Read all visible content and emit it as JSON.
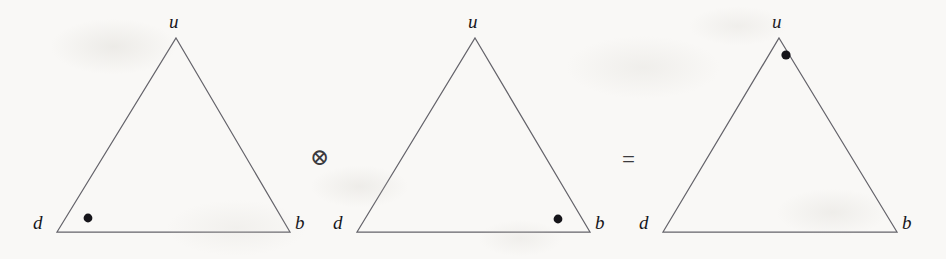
{
  "figure": {
    "caption_text": "",
    "background_color": "#f9f8f6",
    "line_color": "#64636a",
    "dot_color": "#16151a",
    "label_color": "#17161a",
    "width": 946,
    "height": 259
  },
  "triangles": [
    {
      "id": "triangle-left",
      "apex": {
        "x": 176,
        "y": 38
      },
      "bottom_left": {
        "x": 57,
        "y": 232
      },
      "bottom_right": {
        "x": 290,
        "y": 232
      },
      "labels": {
        "top": "u",
        "bottom_left": "d",
        "bottom_right": "b"
      },
      "label_positions": {
        "top": {
          "x": 169,
          "y": 12
        },
        "bottom_left": {
          "x": 33,
          "y": 213
        },
        "bottom_right": {
          "x": 295,
          "y": 213
        }
      },
      "weight_dot": {
        "x": 88,
        "y": 218,
        "radius": 4.4
      }
    },
    {
      "id": "triangle-middle",
      "apex": {
        "x": 475,
        "y": 38
      },
      "bottom_left": {
        "x": 357,
        "y": 232
      },
      "bottom_right": {
        "x": 590,
        "y": 232
      },
      "labels": {
        "top": "u",
        "bottom_left": "d",
        "bottom_right": "b"
      },
      "label_positions": {
        "top": {
          "x": 468,
          "y": 12
        },
        "bottom_left": {
          "x": 333,
          "y": 213
        },
        "bottom_right": {
          "x": 595,
          "y": 213
        }
      },
      "weight_dot": {
        "x": 558,
        "y": 219,
        "radius": 4.4
      }
    },
    {
      "id": "triangle-right",
      "apex": {
        "x": 779,
        "y": 38
      },
      "bottom_left": {
        "x": 663,
        "y": 232
      },
      "bottom_right": {
        "x": 897,
        "y": 232
      },
      "labels": {
        "top": "u",
        "bottom_left": "d",
        "bottom_right": "b"
      },
      "label_positions": {
        "top": {
          "x": 772,
          "y": 12
        },
        "bottom_left": {
          "x": 639,
          "y": 213
        },
        "bottom_right": {
          "x": 902,
          "y": 213
        }
      },
      "weight_dot": {
        "x": 786,
        "y": 55,
        "radius": 4.6
      }
    }
  ],
  "operators": [
    {
      "id": "tensor-product-operator",
      "symbol": "⊗",
      "name": "tensor-product",
      "x": 319,
      "y": 157
    },
    {
      "id": "equals-operator",
      "symbol": "=",
      "name": "equals",
      "x": 631,
      "y": 160
    }
  ]
}
